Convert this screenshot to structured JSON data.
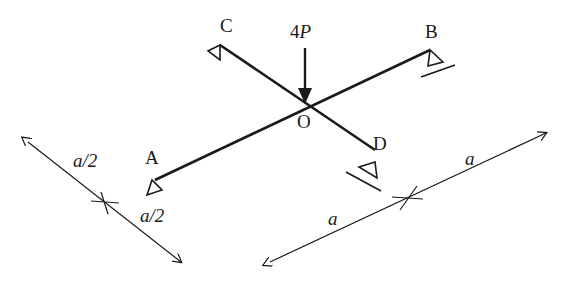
{
  "diagram": {
    "type": "structural-mechanics",
    "colors": {
      "line": "#1a1a1a",
      "background": "#ffffff"
    },
    "points": {
      "A": {
        "label": "A",
        "x": 155,
        "y": 180
      },
      "B": {
        "label": "B",
        "x": 430,
        "y": 50
      },
      "C": {
        "label": "C",
        "x": 220,
        "y": 45
      },
      "D": {
        "label": "D",
        "x": 375,
        "y": 150
      },
      "O": {
        "label": "O",
        "x": 305,
        "y": 105
      }
    },
    "load": {
      "label_num": "4",
      "label_var": "P"
    },
    "dimensions": {
      "left_upper": "a/2",
      "left_lower": "a/2",
      "right_upper": "a",
      "right_lower": "a"
    }
  }
}
